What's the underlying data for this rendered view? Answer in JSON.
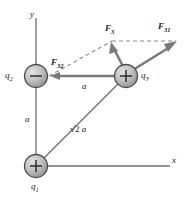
{
  "figure": {
    "kind": "physics-free-body-diagram",
    "colors": {
      "stroke": "#6e6e6e",
      "vector": "#7a7a7a",
      "dashed": "#8a8a8a",
      "sphere_fill": "#b9b9b9",
      "sphere_edge": "#4d4d4d",
      "text": "#1a1a1a"
    }
  },
  "axes": {
    "y_label": "y",
    "x_label": "x"
  },
  "charges": [
    {
      "id": "q1",
      "label": "q",
      "sub": "1",
      "sign": "+",
      "x": 36,
      "y": 166
    },
    {
      "id": "q2",
      "label": "q",
      "sub": "2",
      "sign": "−",
      "x": 36,
      "y": 76
    },
    {
      "id": "q3",
      "label": "q",
      "sub": "3",
      "sign": "+",
      "x": 126,
      "y": 76
    }
  ],
  "distances": [
    {
      "id": "vertical-a",
      "text": "a"
    },
    {
      "id": "horizontal-a",
      "text": "a"
    },
    {
      "id": "diagonal",
      "radical": "√",
      "radicand": "2",
      "text": "a"
    }
  ],
  "vectors": [
    {
      "id": "F32",
      "label": "F",
      "sub": "32",
      "direction": "left"
    },
    {
      "id": "F3",
      "label": "F",
      "sub": "3",
      "direction": "up-left"
    },
    {
      "id": "F31",
      "label": "F",
      "sub": "31",
      "direction": "up-right"
    }
  ]
}
